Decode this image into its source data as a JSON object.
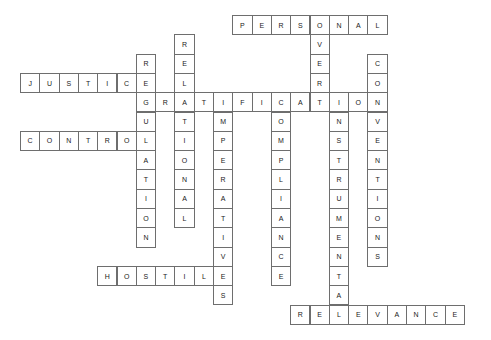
{
  "puzzle": {
    "type": "crossword",
    "title": "",
    "grid": {
      "cell_size": 19.3,
      "origin_x": 20,
      "origin_y": 15,
      "cols": 24,
      "rows": 17
    },
    "style": {
      "background": "#ffffff",
      "cell_fill": "#ffffff",
      "cell_border": "#6e6e6e",
      "letter_color": "#1a1a1a"
    },
    "entries": [
      {
        "id": "personal",
        "answer": "PERSONAL",
        "direction": "across",
        "row": 0,
        "col": 11,
        "length": 8,
        "letters": [
          "P",
          "E",
          "R",
          "S",
          "O",
          "N",
          "A",
          "L"
        ]
      },
      {
        "id": "justice",
        "answer": "JUSTICE",
        "direction": "across",
        "row": 3,
        "col": 0,
        "length": 7,
        "letters": [
          "J",
          "U",
          "S",
          "T",
          "I",
          "C",
          "E"
        ]
      },
      {
        "id": "gratification",
        "answer": "GRATIFICATION",
        "direction": "across",
        "row": 4,
        "col": 6,
        "length": 13,
        "letters": [
          "G",
          "R",
          "A",
          "T",
          "I",
          "F",
          "I",
          "C",
          "A",
          "T",
          "I",
          "O",
          "N"
        ]
      },
      {
        "id": "control",
        "answer": "CONTROL",
        "direction": "across",
        "row": 6,
        "col": 0,
        "length": 7,
        "letters": [
          "C",
          "O",
          "N",
          "T",
          "R",
          "O",
          "L"
        ]
      },
      {
        "id": "hostile",
        "answer": "HOSTILE",
        "direction": "across",
        "row": 13,
        "col": 4,
        "length": 7,
        "letters": [
          "H",
          "O",
          "S",
          "T",
          "I",
          "L",
          "E"
        ]
      },
      {
        "id": "relevance",
        "answer": "RELEVANCE",
        "direction": "across",
        "row": 15,
        "col": 14,
        "length": 9,
        "letters": [
          "R",
          "E",
          "L",
          "E",
          "V",
          "A",
          "N",
          "C",
          "E"
        ]
      },
      {
        "id": "regulation",
        "answer": "REGULATION",
        "direction": "down",
        "row": 2,
        "col": 6,
        "length": 10,
        "letters": [
          "R",
          "E",
          "G",
          "U",
          "L",
          "A",
          "T",
          "I",
          "O",
          "N"
        ]
      },
      {
        "id": "relational",
        "answer": "RELATIONAL",
        "direction": "down",
        "row": 1,
        "col": 8,
        "length": 10,
        "letters": [
          "R",
          "E",
          "L",
          "A",
          "T",
          "I",
          "O",
          "N",
          "A",
          "L"
        ]
      },
      {
        "id": "imperatives",
        "answer": "IMPERATIVES",
        "direction": "down",
        "row": 4,
        "col": 10,
        "length": 11,
        "letters": [
          "I",
          "M",
          "P",
          "E",
          "R",
          "A",
          "T",
          "I",
          "V",
          "E",
          "S"
        ]
      },
      {
        "id": "compliance",
        "answer": "COMPLIANCE",
        "direction": "down",
        "row": 4,
        "col": 13,
        "length": 10,
        "letters": [
          "C",
          "O",
          "M",
          "P",
          "L",
          "I",
          "A",
          "N",
          "C",
          "E"
        ]
      },
      {
        "id": "over",
        "answer": "OVER",
        "direction": "down",
        "row": 0,
        "col": 15,
        "length": 4,
        "letters": [
          "O",
          "V",
          "E",
          "R"
        ]
      },
      {
        "id": "instrumental",
        "answer": "INSTRUMENTAL",
        "direction": "down",
        "row": 4,
        "col": 16,
        "length": 12,
        "letters": [
          "I",
          "N",
          "S",
          "T",
          "R",
          "U",
          "M",
          "E",
          "N",
          "T",
          "A",
          "L"
        ]
      },
      {
        "id": "conventions",
        "answer": "CONVENTIONS",
        "direction": "down",
        "row": 2,
        "col": 18,
        "length": 11,
        "letters": [
          "C",
          "O",
          "N",
          "V",
          "E",
          "N",
          "T",
          "I",
          "O",
          "N",
          "S"
        ]
      }
    ]
  }
}
